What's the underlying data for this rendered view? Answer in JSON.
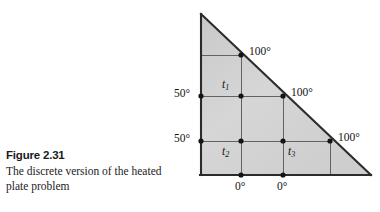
{
  "figure": {
    "number_label": "Figure 2.31",
    "caption": "The discrete version of the heated plate problem"
  },
  "diagram": {
    "shape": "right-triangle",
    "fill_color": "#d4d4d4",
    "edge_color": "#2b2b2b",
    "grid_color": "#4a4a4a",
    "node_color": "#1a1a1a",
    "boundary_labels": {
      "hypotenuse_top": "100°",
      "hypotenuse_middle": "100°",
      "hypotenuse_bottom": "100°",
      "left_upper": "50°",
      "left_lower": "50°",
      "bottom_left": "0°",
      "bottom_right": "0°"
    },
    "interior_nodes": [
      {
        "id": "t1",
        "label": "t",
        "sub": "1"
      },
      {
        "id": "t2",
        "label": "t",
        "sub": "2"
      },
      {
        "id": "t3",
        "label": "t",
        "sub": "3"
      }
    ]
  }
}
